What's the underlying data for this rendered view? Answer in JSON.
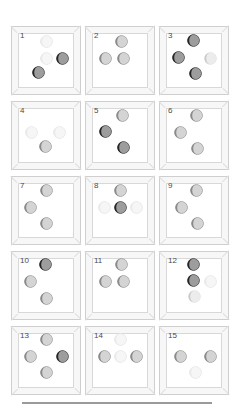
{
  "page": {
    "title": "Moon Phase Cell Grid",
    "background": "#ffffff",
    "divider_color": "#9a9a9a"
  },
  "palette": {
    "dark": "#262626",
    "medium": "#8a8a8a",
    "light": "#c9c9c9",
    "pale": "#eaeaea",
    "lit": "#f2f2f2",
    "frame": "#cfcfcf",
    "frame_fill": "#f7f7f7",
    "inner_fill": "#ffffff",
    "label": "#4a4a4a"
  },
  "grid": {
    "columns": 3,
    "rows": 5,
    "cells": [
      {
        "number": "1",
        "moons": [
          {
            "x": 30,
            "y": 13,
            "tone": "pale"
          },
          {
            "x": 30,
            "y": 30,
            "tone": "pale"
          },
          {
            "x": 46,
            "y": 30,
            "tone": "dark"
          },
          {
            "x": 22,
            "y": 44,
            "tone": "dark"
          }
        ]
      },
      {
        "number": "2",
        "moons": [
          {
            "x": 31,
            "y": 13,
            "tone": "medium"
          },
          {
            "x": 15,
            "y": 30,
            "tone": "medium"
          },
          {
            "x": 33,
            "y": 30,
            "tone": "medium"
          }
        ]
      },
      {
        "number": "3",
        "moons": [
          {
            "x": 29,
            "y": 12,
            "tone": "dark"
          },
          {
            "x": 14,
            "y": 29,
            "tone": "dark"
          },
          {
            "x": 46,
            "y": 30,
            "tone": "light"
          },
          {
            "x": 31,
            "y": 45,
            "tone": "dark"
          }
        ]
      },
      {
        "number": "4",
        "moons": [
          {
            "x": 15,
            "y": 29,
            "tone": "pale"
          },
          {
            "x": 43,
            "y": 29,
            "tone": "pale"
          },
          {
            "x": 29,
            "y": 43,
            "tone": "medium"
          }
        ]
      },
      {
        "number": "5",
        "moons": [
          {
            "x": 32,
            "y": 12,
            "tone": "medium"
          },
          {
            "x": 15,
            "y": 28,
            "tone": "dark"
          },
          {
            "x": 33,
            "y": 44,
            "tone": "dark"
          }
        ]
      },
      {
        "number": "6",
        "moons": [
          {
            "x": 32,
            "y": 12,
            "tone": "medium"
          },
          {
            "x": 16,
            "y": 29,
            "tone": "medium"
          },
          {
            "x": 33,
            "y": 45,
            "tone": "medium"
          }
        ]
      },
      {
        "number": "7",
        "moons": [
          {
            "x": 30,
            "y": 12,
            "tone": "medium"
          },
          {
            "x": 14,
            "y": 29,
            "tone": "medium"
          },
          {
            "x": 30,
            "y": 45,
            "tone": "medium"
          }
        ]
      },
      {
        "number": "8",
        "moons": [
          {
            "x": 30,
            "y": 12,
            "tone": "medium"
          },
          {
            "x": 14,
            "y": 29,
            "tone": "pale"
          },
          {
            "x": 30,
            "y": 29,
            "tone": "dark"
          },
          {
            "x": 46,
            "y": 29,
            "tone": "pale"
          }
        ]
      },
      {
        "number": "9",
        "moons": [
          {
            "x": 32,
            "y": 12,
            "tone": "medium"
          },
          {
            "x": 17,
            "y": 29,
            "tone": "medium"
          },
          {
            "x": 33,
            "y": 45,
            "tone": "medium"
          }
        ]
      },
      {
        "number": "10",
        "moons": [
          {
            "x": 29,
            "y": 11,
            "tone": "dark"
          },
          {
            "x": 14,
            "y": 28,
            "tone": "medium"
          },
          {
            "x": 30,
            "y": 45,
            "tone": "medium"
          }
        ]
      },
      {
        "number": "11",
        "moons": [
          {
            "x": 31,
            "y": 11,
            "tone": "medium"
          },
          {
            "x": 15,
            "y": 28,
            "tone": "medium"
          },
          {
            "x": 33,
            "y": 28,
            "tone": "medium"
          }
        ]
      },
      {
        "number": "12",
        "moons": [
          {
            "x": 29,
            "y": 11,
            "tone": "dark"
          },
          {
            "x": 29,
            "y": 27,
            "tone": "dark"
          },
          {
            "x": 46,
            "y": 28,
            "tone": "pale"
          },
          {
            "x": 30,
            "y": 43,
            "tone": "light"
          }
        ]
      },
      {
        "number": "13",
        "moons": [
          {
            "x": 30,
            "y": 11,
            "tone": "medium"
          },
          {
            "x": 14,
            "y": 28,
            "tone": "medium"
          },
          {
            "x": 46,
            "y": 28,
            "tone": "dark"
          },
          {
            "x": 30,
            "y": 44,
            "tone": "medium"
          }
        ]
      },
      {
        "number": "14",
        "moons": [
          {
            "x": 30,
            "y": 11,
            "tone": "pale"
          },
          {
            "x": 14,
            "y": 28,
            "tone": "medium"
          },
          {
            "x": 30,
            "y": 28,
            "tone": "pale"
          },
          {
            "x": 46,
            "y": 28,
            "tone": "medium"
          }
        ]
      },
      {
        "number": "15",
        "moons": [
          {
            "x": 16,
            "y": 28,
            "tone": "medium"
          },
          {
            "x": 46,
            "y": 28,
            "tone": "medium"
          },
          {
            "x": 31,
            "y": 44,
            "tone": "pale"
          }
        ]
      }
    ]
  }
}
